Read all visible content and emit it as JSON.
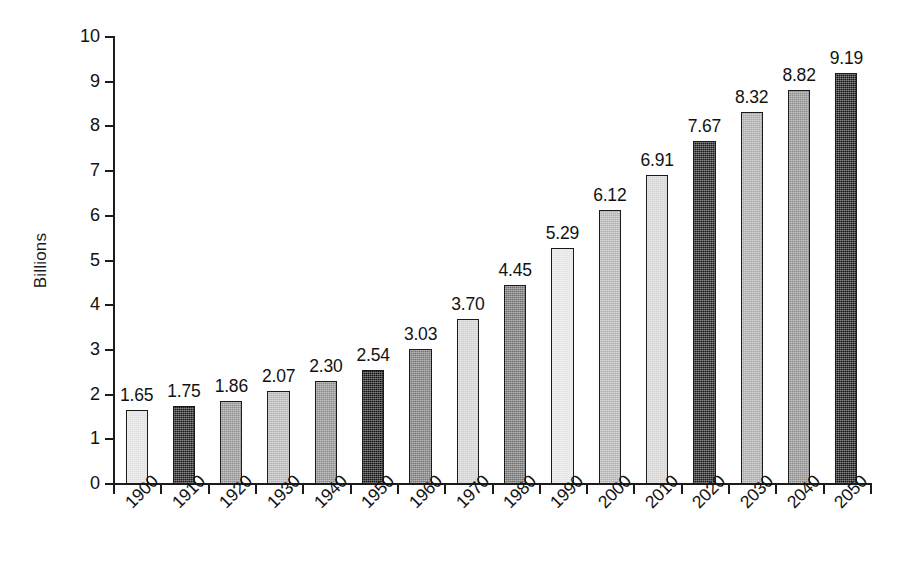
{
  "chart_data": {
    "type": "bar",
    "title": "",
    "subtitle": "",
    "xlabel": "",
    "ylabel": "Billions",
    "ylim": [
      0,
      10
    ],
    "ytick_labels": [
      "0",
      "1",
      "2",
      "3",
      "4",
      "5",
      "6",
      "7",
      "8",
      "9",
      "10"
    ],
    "ytick_values": [
      0,
      1,
      2,
      3,
      4,
      5,
      6,
      7,
      8,
      9,
      10
    ],
    "grid": false,
    "legend": null,
    "categories": [
      "1900",
      "1910",
      "1920",
      "1930",
      "1940",
      "1950",
      "1960",
      "1970",
      "1980",
      "1990",
      "2000",
      "2010",
      "2020",
      "2030",
      "2040",
      "2050"
    ],
    "values": [
      1.65,
      1.75,
      1.86,
      2.07,
      2.3,
      2.54,
      3.03,
      3.7,
      4.45,
      5.29,
      6.12,
      6.91,
      7.67,
      8.32,
      8.82,
      9.19
    ],
    "data_labels": [
      "1.65",
      "1.75",
      "1.86",
      "2.07",
      "2.30",
      "2.54",
      "3.03",
      "3.70",
      "4.45",
      "5.29",
      "6.12",
      "6.91",
      "7.67",
      "8.32",
      "8.82",
      "9.19"
    ],
    "bar_colors": [
      "#e0e0e0",
      "#1a1a1a",
      "#8f8f8f",
      "#b4b4b4",
      "#8a8a8a",
      "#111111",
      "#767676",
      "#cfcfcf",
      "#6e6e6e",
      "#e3e3e3",
      "#b0b0b0",
      "#d3d3d3",
      "#1a1a1a",
      "#a8a8a8",
      "#8c8c8c",
      "#141414"
    ],
    "bar_edge_color": "#1a1a1a",
    "axis_color": "#1c1c1c",
    "background_color": "#ffffff"
  }
}
